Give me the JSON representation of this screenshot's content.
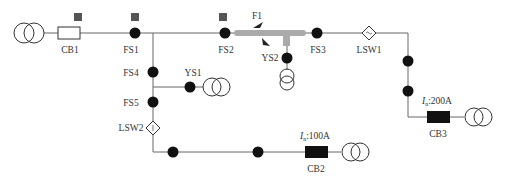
{
  "diagram": {
    "type": "distribution-network-single-line",
    "colors": {
      "line": "#555555",
      "node": "#111111",
      "marker": "#555555",
      "fault_section": "#aaaaaa",
      "breaker_closed": "#111111"
    },
    "sources": {
      "main_transformer": "T-source"
    },
    "labels": {
      "cb1": "CB1",
      "cb2": "CB2",
      "cb3": "CB3",
      "fs1": "FS1",
      "fs2": "FS2",
      "fs3": "FS3",
      "fs4": "FS4",
      "fs5": "FS5",
      "ys1": "YS1",
      "ys2": "YS2",
      "lsw1": "LSW1",
      "lsw2": "LSW2",
      "fault": "F1",
      "cb2_rating_sym": "I",
      "cb2_rating_sub": "n",
      "cb2_rating_val": ":100A",
      "cb3_rating_sym": "I",
      "cb3_rating_sub": "n",
      "cb3_rating_val": ":200A"
    }
  }
}
